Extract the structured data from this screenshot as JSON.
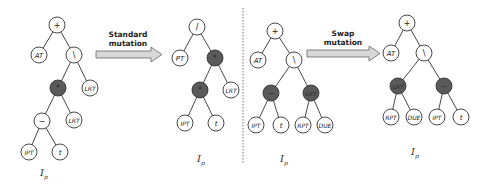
{
  "arrows": {
    "standard": {
      "line1": "Standard",
      "line2": "mutation"
    },
    "swap": {
      "line1": "Swap",
      "line2": "mutation"
    }
  },
  "tree_label": {
    "main": "I",
    "sub": "p"
  },
  "colors": {
    "mutated_node": "#5a5a5a",
    "normal_node": "#ffffff",
    "arrow_fill": "#d8d8d8"
  },
  "trees": [
    {
      "id": "standard-before",
      "nodes": [
        {
          "label": "+",
          "x": 57,
          "y": 25,
          "dark": false,
          "op": true
        },
        {
          "label": "AT",
          "x": 39,
          "y": 55,
          "dark": false
        },
        {
          "label": "\\",
          "x": 74,
          "y": 55,
          "dark": false,
          "op": true
        },
        {
          "label": "*",
          "x": 58,
          "y": 88,
          "dark": true,
          "op": true
        },
        {
          "label": "LRT",
          "x": 90,
          "y": 88,
          "dark": false
        },
        {
          "label": "−",
          "x": 42,
          "y": 121,
          "dark": false,
          "op": true
        },
        {
          "label": "LRT",
          "x": 74,
          "y": 120,
          "dark": false
        },
        {
          "label": "IPT",
          "x": 29,
          "y": 152,
          "dark": false
        },
        {
          "label": "t",
          "x": 60,
          "y": 152,
          "dark": false
        }
      ],
      "edges": [
        [
          0,
          1
        ],
        [
          0,
          2
        ],
        [
          2,
          3
        ],
        [
          2,
          4
        ],
        [
          3,
          5
        ],
        [
          3,
          6
        ],
        [
          5,
          7
        ],
        [
          5,
          8
        ]
      ],
      "label_pos": {
        "x": 44,
        "y": 176
      }
    },
    {
      "id": "standard-after",
      "nodes": [
        {
          "label": "/",
          "x": 197,
          "y": 27,
          "dark": false,
          "op": true
        },
        {
          "label": "PT",
          "x": 180,
          "y": 58,
          "dark": false
        },
        {
          "label": "*",
          "x": 215,
          "y": 58,
          "dark": true,
          "op": true
        },
        {
          "label": "*",
          "x": 200,
          "y": 90,
          "dark": true,
          "op": true
        },
        {
          "label": "LRT",
          "x": 231,
          "y": 90,
          "dark": false
        },
        {
          "label": "IPT",
          "x": 185,
          "y": 123,
          "dark": false
        },
        {
          "label": "t",
          "x": 216,
          "y": 123,
          "dark": false
        }
      ],
      "edges": [
        [
          0,
          1
        ],
        [
          0,
          2
        ],
        [
          2,
          3
        ],
        [
          2,
          4
        ],
        [
          3,
          5
        ],
        [
          3,
          6
        ]
      ],
      "label_pos": {
        "x": 201,
        "y": 162
      }
    },
    {
      "id": "swap-before",
      "nodes": [
        {
          "label": "+",
          "x": 275,
          "y": 31,
          "dark": false,
          "op": true
        },
        {
          "label": "AT",
          "x": 258,
          "y": 60,
          "dark": false
        },
        {
          "label": "\\",
          "x": 294,
          "y": 60,
          "dark": false,
          "op": true
        },
        {
          "label": "−",
          "x": 271,
          "y": 93,
          "dark": true,
          "op": true
        },
        {
          "label": "LRT",
          "x": 311,
          "y": 93,
          "dark": true
        },
        {
          "label": "IPT",
          "x": 256,
          "y": 125,
          "dark": false
        },
        {
          "label": "t",
          "x": 281,
          "y": 125,
          "dark": false
        },
        {
          "label": "RPT",
          "x": 303,
          "y": 125,
          "dark": false
        },
        {
          "label": "DUE",
          "x": 325,
          "y": 125,
          "dark": false
        }
      ],
      "edges": [
        [
          0,
          1
        ],
        [
          0,
          2
        ],
        [
          2,
          3
        ],
        [
          2,
          4
        ],
        [
          3,
          5
        ],
        [
          3,
          6
        ],
        [
          4,
          7
        ],
        [
          4,
          8
        ]
      ],
      "label_pos": {
        "x": 284,
        "y": 162
      }
    },
    {
      "id": "swap-after",
      "nodes": [
        {
          "label": "+",
          "x": 407,
          "y": 23,
          "dark": false,
          "op": true
        },
        {
          "label": "AT",
          "x": 391,
          "y": 53,
          "dark": false
        },
        {
          "label": "\\",
          "x": 424,
          "y": 53,
          "dark": false,
          "op": true
        },
        {
          "label": "LRT",
          "x": 398,
          "y": 86,
          "dark": true
        },
        {
          "label": "−",
          "x": 444,
          "y": 86,
          "dark": true,
          "op": true
        },
        {
          "label": "RPT",
          "x": 391,
          "y": 117,
          "dark": false
        },
        {
          "label": "DUE",
          "x": 414,
          "y": 117,
          "dark": false
        },
        {
          "label": "IPT",
          "x": 437,
          "y": 117,
          "dark": false
        },
        {
          "label": "t",
          "x": 461,
          "y": 117,
          "dark": false
        }
      ],
      "edges": [
        [
          0,
          1
        ],
        [
          0,
          2
        ],
        [
          2,
          3
        ],
        [
          2,
          4
        ],
        [
          3,
          5
        ],
        [
          3,
          6
        ],
        [
          4,
          7
        ],
        [
          4,
          8
        ]
      ],
      "label_pos": {
        "x": 415,
        "y": 155
      }
    }
  ]
}
